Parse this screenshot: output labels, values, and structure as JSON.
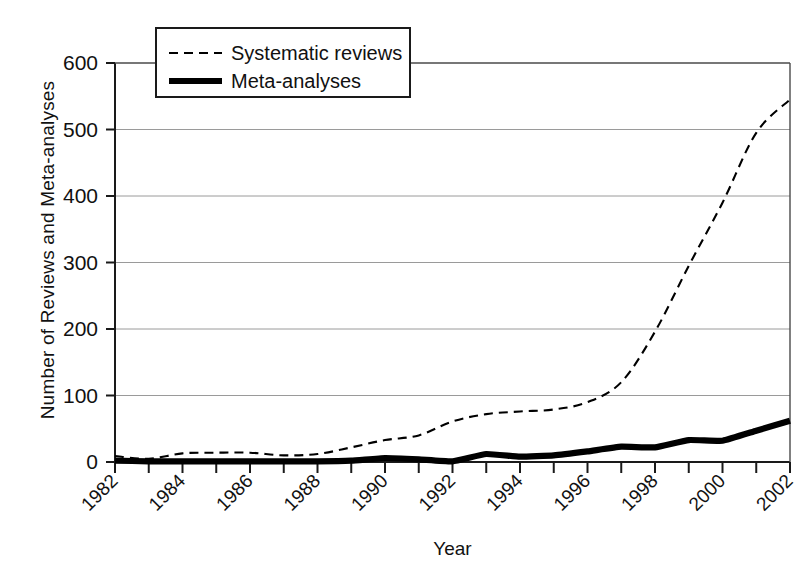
{
  "chart_data": {
    "type": "line",
    "title": "",
    "xlabel": "Year",
    "ylabel": "Number of Reviews and Meta-analyses",
    "xlim": [
      1982,
      2002
    ],
    "ylim": [
      0,
      600
    ],
    "ytick_values": [
      0,
      100,
      200,
      300,
      400,
      500,
      600
    ],
    "ytick_labels": [
      "0",
      "100",
      "200",
      "300",
      "400",
      "500",
      "600"
    ],
    "xtick_values": [
      1982,
      1983,
      1984,
      1985,
      1986,
      1987,
      1988,
      1989,
      1990,
      1991,
      1992,
      1993,
      1994,
      1995,
      1996,
      1997,
      1998,
      1999,
      2000,
      2001,
      2002
    ],
    "xtick_labels": [
      "1982",
      "",
      "1984",
      "",
      "1986",
      "",
      "1988",
      "",
      "1990",
      "",
      "1992",
      "",
      "1994",
      "",
      "1996",
      "",
      "1998",
      "",
      "2000",
      "",
      "2002"
    ],
    "xtick_labels_shown": [
      "1982",
      "1984",
      "1986",
      "1988",
      "1990",
      "1992",
      "1994",
      "1996",
      "1998",
      "2000",
      "2002"
    ],
    "grid": true,
    "grid_axis": "y",
    "legend_position": "top-left",
    "x": [
      1982,
      1983,
      1984,
      1985,
      1986,
      1987,
      1988,
      1989,
      1990,
      1991,
      1992,
      1993,
      1994,
      1995,
      1996,
      1997,
      1998,
      1999,
      2000,
      2001,
      2002
    ],
    "series": [
      {
        "name": "Systematic reviews",
        "style": "dashed",
        "color": "#000000",
        "values": [
          9,
          5,
          13,
          14,
          14,
          10,
          12,
          22,
          33,
          40,
          61,
          72,
          76,
          79,
          90,
          120,
          196,
          295,
          390,
          495,
          545
        ]
      },
      {
        "name": "Meta-analyses",
        "style": "solid",
        "color": "#000000",
        "values": [
          2,
          1,
          1,
          1,
          1,
          1,
          1,
          2,
          6,
          4,
          1,
          12,
          8,
          10,
          16,
          23,
          22,
          33,
          32,
          47,
          62
        ]
      }
    ]
  },
  "legend": {
    "entries": [
      {
        "label": "Systematic reviews",
        "style": "dashed"
      },
      {
        "label": "Meta-analyses",
        "style": "solid"
      }
    ]
  },
  "axes": {
    "y_title": "Number of Reviews and Meta-analyses",
    "x_title": "Year"
  }
}
